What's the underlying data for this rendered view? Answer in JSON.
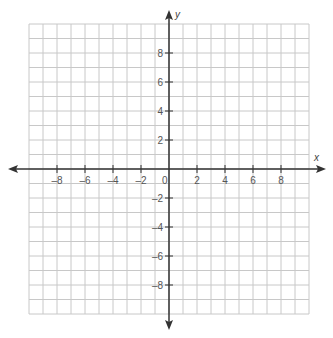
{
  "chart_data": {
    "type": "scatter",
    "title": "",
    "xlabel": "x",
    "ylabel": "y",
    "xlim": [
      -10,
      10
    ],
    "ylim": [
      -10,
      10
    ],
    "grid": true,
    "grid_step": 1,
    "x_ticks": [
      -8,
      -6,
      -4,
      -2,
      2,
      4,
      6,
      8
    ],
    "y_ticks": [
      8,
      6,
      4,
      2,
      -2,
      -4,
      -6,
      -8
    ],
    "origin_label": "0",
    "series": [],
    "legend": null
  },
  "layout": {
    "origin_px": [
      169,
      169
    ],
    "unit_x_px": 14.0,
    "unit_y_px": 14.5,
    "grid_color": "#c8c8c8",
    "axis_color": "#333333"
  }
}
